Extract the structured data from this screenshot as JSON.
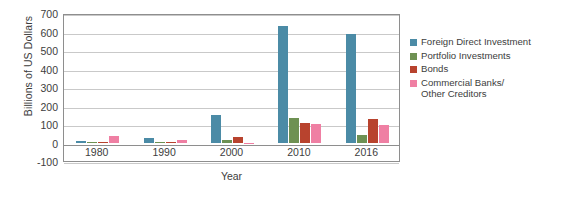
{
  "chart_data": {
    "type": "bar",
    "title": "",
    "subtitle": "",
    "xlabel": "Year",
    "ylabel": "Billions of US Dollars",
    "categories": [
      "1980",
      "1990",
      "2000",
      "2010",
      "2016"
    ],
    "ylim": [
      -100,
      700
    ],
    "yticks": [
      700,
      600,
      500,
      400,
      300,
      200,
      100,
      0,
      -100
    ],
    "ytick_labels": [
      "700",
      "600",
      "500",
      "400",
      "300",
      "200",
      "100",
      "0",
      "-100"
    ],
    "grid": true,
    "grid_axis": "y",
    "legend_position": "right",
    "series": [
      {
        "name": "Foreign Direct Investment",
        "color": "#4b8ba6",
        "values": [
          8,
          22,
          150,
          628,
          585
        ]
      },
      {
        "name": "Portfolio Investments",
        "color": "#6e9153",
        "values": [
          2,
          3,
          15,
          130,
          40
        ]
      },
      {
        "name": "Bonds",
        "color": "#b8432e",
        "values": [
          2,
          2,
          30,
          105,
          125
        ]
      },
      {
        "name": "Commercial Banks/\nOther Creditors",
        "color": "#ef7fa3",
        "values": [
          35,
          15,
          -10,
          100,
          95
        ]
      }
    ]
  },
  "legend": {
    "items": [
      {
        "label": "Foreign Direct Investment",
        "color": "#4b8ba6"
      },
      {
        "label": "Portfolio Investments",
        "color": "#6e9153"
      },
      {
        "label": "Bonds",
        "color": "#b8432e"
      },
      {
        "label": "Commercial Banks/\nOther Creditors",
        "color": "#ef7fa3"
      }
    ]
  },
  "colors": {
    "axis": "#8e8e8e",
    "grid": "#c9c9c9",
    "text": "#3d3d3d",
    "background": "#ffffff"
  }
}
